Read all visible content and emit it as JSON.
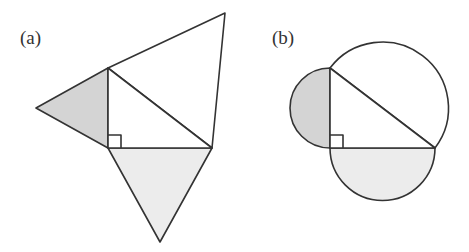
{
  "figure": {
    "panels": [
      {
        "id": "a",
        "label": "(a)",
        "description": "Right triangle with equilateral triangles on each side",
        "right_triangle": {
          "right_angle_vertex": [
            108,
            148
          ],
          "top_vertex": [
            108,
            68
          ],
          "right_vertex": [
            212,
            148
          ]
        },
        "shapes": [
          {
            "name": "left-leg-triangle",
            "apex": [
              36,
              108
            ],
            "fill": "#d4d4d4"
          },
          {
            "name": "bottom-leg-triangle",
            "apex": [
              160,
              242
            ],
            "fill": "#ececec"
          },
          {
            "name": "hypotenuse-triangle",
            "apex": [
              225,
              13
            ],
            "fill": "#ffffff"
          }
        ]
      },
      {
        "id": "b",
        "label": "(b)",
        "description": "Right triangle with semicircles on each side",
        "right_triangle": {
          "right_angle_vertex": [
            330,
            148
          ],
          "top_vertex": [
            330,
            68
          ],
          "right_vertex": [
            435,
            148
          ]
        },
        "shapes": [
          {
            "name": "left-leg-semicircle",
            "center": [
              330,
              108
            ],
            "radius": 40,
            "fill": "#d4d4d4"
          },
          {
            "name": "bottom-leg-semicircle",
            "center": [
              382.5,
              148
            ],
            "radius": 52.5,
            "fill": "#ececec"
          },
          {
            "name": "hypotenuse-semicircle",
            "center": [
              382.5,
              108
            ],
            "radius": 66,
            "fill": "#ffffff"
          }
        ]
      }
    ],
    "colors": {
      "stroke": "#333333",
      "dark_shade": "#d4d4d4",
      "light_shade": "#ececec",
      "background": "#ffffff"
    }
  }
}
